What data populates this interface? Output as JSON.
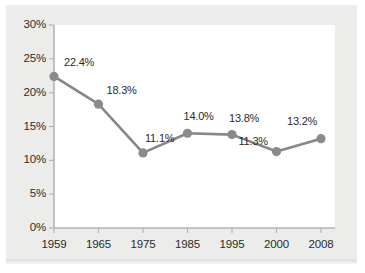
{
  "chart_data": {
    "type": "line",
    "title": "",
    "subtitle": "",
    "xlabel": "",
    "ylabel": "",
    "categories": [
      "1959",
      "1965",
      "1975",
      "1985",
      "1995",
      "2000",
      "2008"
    ],
    "values": [
      22.4,
      18.3,
      11.1,
      14.0,
      13.8,
      11.3,
      13.2
    ],
    "point_labels": [
      "22.4%",
      "18.3%",
      "11.1%",
      "14.0%",
      "13.8%",
      "11.3%",
      "13.2%"
    ],
    "series": [
      {
        "name": "",
        "values": [
          22.4,
          18.3,
          11.1,
          14.0,
          13.8,
          11.3,
          13.2
        ]
      }
    ],
    "ylim": [
      0,
      30
    ],
    "ytick_values": [
      0,
      5,
      10,
      15,
      20,
      25,
      30
    ],
    "ytick_labels": [
      "0%",
      "5%",
      "10%",
      "15%",
      "20%",
      "25%",
      "30%"
    ],
    "xtick_labels": [
      "1959",
      "1965",
      "1975",
      "1985",
      "1995",
      "2000",
      "2008"
    ],
    "grid": false,
    "legend": "none",
    "annotations": []
  },
  "style": {
    "series_color": "#878787",
    "marker_color": "#8a8a8a",
    "axis_color": "#b5b5b5",
    "text_color": "#2b2b2b",
    "panel_background": "#ececea",
    "plot_background": "#ffffff"
  }
}
